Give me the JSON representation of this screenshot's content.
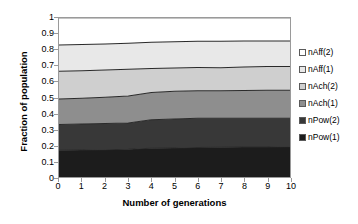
{
  "chart_data": {
    "type": "area",
    "stacked": true,
    "title": "",
    "xlabel": "Number of generations",
    "ylabel": "Fraction of population",
    "x": [
      0,
      1,
      2,
      3,
      4,
      5,
      6,
      7,
      8,
      9,
      10
    ],
    "xlim": [
      0,
      10
    ],
    "ylim": [
      0,
      1
    ],
    "xticks": [
      "0",
      "1",
      "2",
      "3",
      "4",
      "5",
      "6",
      "7",
      "8",
      "9",
      "10"
    ],
    "yticks": [
      "0",
      "0.1",
      "0.2",
      "0.3",
      "0.4",
      "0.5",
      "0.6",
      "0.7",
      "0.8",
      "0.9",
      "1"
    ],
    "grid": false,
    "legend_position": "right",
    "series": [
      {
        "name": "nPow(1)",
        "color": "#1c1c1c",
        "values": [
          0.168,
          0.17,
          0.172,
          0.174,
          0.181,
          0.183,
          0.186,
          0.187,
          0.188,
          0.189,
          0.19
        ],
        "cumulative": [
          0.168,
          0.17,
          0.172,
          0.174,
          0.181,
          0.183,
          0.186,
          0.187,
          0.188,
          0.189,
          0.19
        ]
      },
      {
        "name": "nPow(2)",
        "color": "#383838",
        "values": [
          0.162,
          0.163,
          0.164,
          0.166,
          0.179,
          0.181,
          0.183,
          0.182,
          0.181,
          0.181,
          0.18
        ],
        "cumulative": [
          0.33,
          0.333,
          0.336,
          0.34,
          0.36,
          0.364,
          0.369,
          0.369,
          0.369,
          0.37,
          0.37
        ]
      },
      {
        "name": "nAch(1)",
        "color": "#8e8e8e",
        "values": [
          0.16,
          0.162,
          0.165,
          0.17,
          0.172,
          0.175,
          0.174,
          0.174,
          0.175,
          0.175,
          0.175
        ],
        "cumulative": [
          0.49,
          0.495,
          0.501,
          0.51,
          0.532,
          0.539,
          0.543,
          0.543,
          0.544,
          0.545,
          0.545
        ]
      },
      {
        "name": "nAch(2)",
        "color": "#cfcfcf",
        "values": [
          0.175,
          0.174,
          0.172,
          0.168,
          0.15,
          0.147,
          0.145,
          0.144,
          0.148,
          0.15,
          0.15
        ],
        "cumulative": [
          0.665,
          0.669,
          0.673,
          0.678,
          0.682,
          0.686,
          0.688,
          0.687,
          0.692,
          0.695,
          0.695
        ]
      },
      {
        "name": "nAff(1)",
        "color": "#e8e8e8",
        "values": [
          0.165,
          0.164,
          0.164,
          0.163,
          0.166,
          0.165,
          0.165,
          0.167,
          0.163,
          0.16,
          0.16
        ],
        "cumulative": [
          0.83,
          0.833,
          0.837,
          0.841,
          0.848,
          0.851,
          0.853,
          0.854,
          0.855,
          0.855,
          0.855
        ]
      },
      {
        "name": "nAff(2)",
        "color": "#ffffff",
        "values": [
          0.17,
          0.167,
          0.163,
          0.159,
          0.152,
          0.149,
          0.147,
          0.146,
          0.145,
          0.145,
          0.145
        ],
        "cumulative": [
          1.0,
          1.0,
          1.0,
          1.0,
          1.0,
          1.0,
          1.0,
          1.0,
          1.0,
          1.0,
          1.0
        ]
      }
    ],
    "legend": [
      {
        "label": "nAff(2)",
        "color": "#ffffff"
      },
      {
        "label": "nAff(1)",
        "color": "#e8e8e8"
      },
      {
        "label": "nAch(2)",
        "color": "#cfcfcf"
      },
      {
        "label": "nAch(1)",
        "color": "#8e8e8e"
      },
      {
        "label": "nPow(2)",
        "color": "#383838"
      },
      {
        "label": "nPow(1)",
        "color": "#1c1c1c"
      }
    ]
  }
}
